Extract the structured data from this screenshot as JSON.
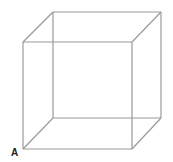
{
  "figure": {
    "type": "wireframe-cube",
    "stroke_color": "#9a9a9a",
    "stroke_width": 1.2,
    "vertices": {
      "front_top_left": [
        23,
        42
      ],
      "front_top_right": [
        132,
        42
      ],
      "front_bottom_left": [
        23,
        149
      ],
      "front_bottom_right": [
        132,
        149
      ],
      "back_top_left": [
        53,
        12
      ],
      "back_top_right": [
        161,
        12
      ],
      "back_bottom_left": [
        53,
        118
      ],
      "back_bottom_right": [
        161,
        118
      ]
    },
    "vertex_label": {
      "text": "A",
      "vertex": "front_bottom_left",
      "position": [
        11,
        147
      ]
    }
  }
}
